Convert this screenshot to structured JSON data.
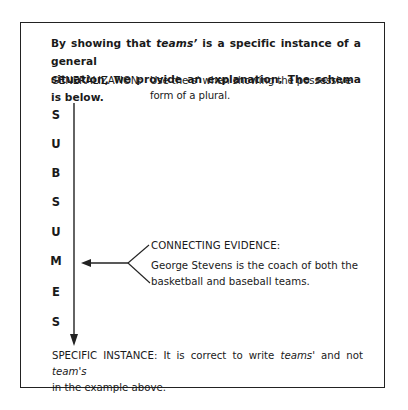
{
  "title": {
    "line1_prefix": "By showing that ",
    "line1_em": "teams’",
    "line1_suffix": " is a specific instance of a general",
    "line2": "situation, we provide an explanation. The schema is below."
  },
  "generalization": {
    "label": "GENERALIZATION:",
    "text": "Use the s' when showing the possessive form of a plural."
  },
  "subsumes": {
    "letters": [
      "S",
      "U",
      "B",
      "S",
      "U",
      "M",
      "E",
      "S"
    ],
    "word": "SUBSUMES"
  },
  "connecting_evidence": {
    "label": "CONNECTING EVIDENCE:",
    "line1": "George Stevens is the coach of both the",
    "line2": "basketball and baseball teams."
  },
  "specific_instance": {
    "line1_prefix": "SPECIFIC INSTANCE: It is correct to write ",
    "line1_em1": "teams'",
    "line1_mid": " and not ",
    "line1_em2": "team's",
    "line2": "in the example above."
  },
  "colors": {
    "ink": "#1a1a1a",
    "border": "#222222",
    "background": "#ffffff"
  }
}
